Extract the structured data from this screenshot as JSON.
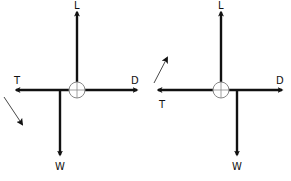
{
  "diagrams": [
    {
      "name": "force-diagram-left",
      "labels": {
        "lift": "L",
        "thrust": "T",
        "drag": "D",
        "weight": "W"
      },
      "motion_arrow_direction": "down-right"
    },
    {
      "name": "force-diagram-right",
      "labels": {
        "lift": "L",
        "thrust": "T",
        "drag": "D",
        "weight": "W"
      },
      "motion_arrow_direction": "up-right"
    }
  ],
  "colors": {
    "arrow": "#111111",
    "circle": "#888888",
    "background": "#ffffff"
  }
}
